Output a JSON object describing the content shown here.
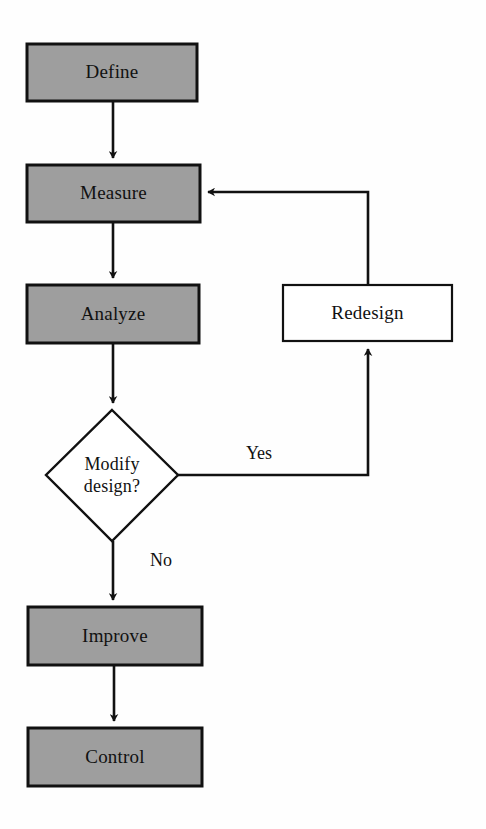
{
  "diagram": {
    "background_color": "#fefefe",
    "fill_gray": "#9e9e9e",
    "fill_white": "#ffffff",
    "stroke_color": "#111111",
    "nodes": [
      {
        "id": "define",
        "label": "Define",
        "shape": "rectangle",
        "fill": "#9e9e9e",
        "x": 27,
        "y": 44,
        "w": 170,
        "h": 57
      },
      {
        "id": "measure",
        "label": "Measure",
        "shape": "rectangle",
        "fill": "#9e9e9e",
        "x": 27,
        "y": 165,
        "w": 173,
        "h": 57
      },
      {
        "id": "analyze",
        "label": "Analyze",
        "shape": "rectangle",
        "fill": "#9e9e9e",
        "x": 27,
        "y": 285,
        "w": 172,
        "h": 58
      },
      {
        "id": "modify-design",
        "label": "Modify\ndesign?",
        "shape": "diamond",
        "fill": "#ffffff",
        "x": 46,
        "y": 410,
        "w": 132,
        "h": 131
      },
      {
        "id": "redesign",
        "label": "Redesign",
        "shape": "rectangle",
        "fill": "#ffffff",
        "x": 283,
        "y": 285,
        "w": 169,
        "h": 56
      },
      {
        "id": "improve",
        "label": "Improve",
        "shape": "rectangle",
        "fill": "#9e9e9e",
        "x": 28,
        "y": 607,
        "w": 174,
        "h": 58
      },
      {
        "id": "control",
        "label": "Control",
        "shape": "rectangle",
        "fill": "#9e9e9e",
        "x": 28,
        "y": 728,
        "w": 174,
        "h": 58
      }
    ],
    "edges": [
      {
        "id": "define-to-measure",
        "from": "define",
        "to": "measure",
        "label": ""
      },
      {
        "id": "measure-to-analyze",
        "from": "measure",
        "to": "analyze",
        "label": ""
      },
      {
        "id": "analyze-to-modify-design",
        "from": "analyze",
        "to": "modify-design",
        "label": ""
      },
      {
        "id": "modify-design-yes-to-redesign",
        "from": "modify-design",
        "to": "redesign",
        "label": "Yes"
      },
      {
        "id": "redesign-to-measure",
        "from": "redesign",
        "to": "measure",
        "label": ""
      },
      {
        "id": "modify-design-no-to-improve",
        "from": "modify-design",
        "to": "improve",
        "label": "No"
      },
      {
        "id": "improve-to-control",
        "from": "improve",
        "to": "control",
        "label": ""
      }
    ],
    "edge_labels": [
      {
        "id": "yes-label",
        "text": "Yes",
        "x": 232,
        "y": 443,
        "w": 54
      },
      {
        "id": "no-label",
        "text": "No",
        "x": 140,
        "y": 550,
        "w": 42
      }
    ]
  }
}
